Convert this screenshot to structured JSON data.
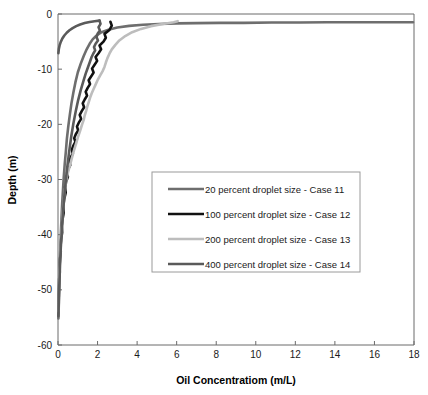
{
  "chart_data": {
    "type": "line",
    "title": "",
    "xlabel": "Oil Concentratiom (m/L)",
    "ylabel": "Depth (m)",
    "xlim": [
      0,
      18
    ],
    "ylim": [
      -60,
      0
    ],
    "grid": false,
    "legend_position": "center",
    "xticks": [
      "0",
      "2",
      "4",
      "6",
      "8",
      "10",
      "12",
      "14",
      "16",
      "18"
    ],
    "xtick_values": [
      0,
      2,
      4,
      6,
      8,
      10,
      12,
      14,
      16,
      18
    ],
    "yticks": [
      "0",
      "-10",
      "-20",
      "-30",
      "-40",
      "-50",
      "-60"
    ],
    "ytick_values": [
      0,
      -10,
      -20,
      -30,
      -40,
      -50,
      -60
    ],
    "series": [
      {
        "name": "20 percent droplet size - Case 11",
        "color": "#6e6e6e",
        "width": 2.6,
        "x": [
          17.95,
          16.4,
          15.0,
          13.6,
          12.2,
          10.8,
          9.4,
          8.2,
          7.0,
          6.0,
          5.1,
          4.3,
          3.6,
          3.0,
          2.55,
          2.2,
          1.95,
          1.75,
          1.6,
          1.45,
          1.3,
          1.15,
          1.0,
          0.88,
          0.78,
          0.68,
          0.6,
          0.52,
          0.45,
          0.4,
          0.34,
          0.29,
          0.25,
          0.21,
          0.18,
          0.15,
          0.13,
          0.1,
          0.08,
          0.06,
          0.05,
          0.04,
          0.03,
          0.02
        ],
        "y": [
          -1.5,
          -1.5,
          -1.5,
          -1.5,
          -1.55,
          -1.55,
          -1.6,
          -1.6,
          -1.65,
          -1.7,
          -1.8,
          -1.95,
          -2.15,
          -2.45,
          -2.85,
          -3.3,
          -3.9,
          -4.6,
          -5.4,
          -6.4,
          -7.6,
          -9.0,
          -10.6,
          -12.4,
          -14.2,
          -16.2,
          -18.2,
          -20.4,
          -22.6,
          -24.8,
          -27.2,
          -29.6,
          -32.0,
          -34.4,
          -36.8,
          -39.2,
          -41.6,
          -44.0,
          -46.4,
          -48.8,
          -51.0,
          -52.8,
          -54.2,
          -55.2
        ]
      },
      {
        "name": "100 percent droplet size - Case 12",
        "color": "#111111",
        "width": 2.6,
        "x": [
          2.65,
          2.72,
          2.6,
          2.35,
          2.42,
          2.3,
          2.1,
          2.18,
          2.05,
          1.9,
          1.98,
          1.85,
          1.72,
          1.8,
          1.68,
          1.55,
          1.62,
          1.5,
          1.4,
          1.47,
          1.35,
          1.25,
          1.32,
          1.2,
          1.1,
          1.17,
          1.05,
          0.96,
          1.02,
          0.9,
          0.82,
          0.88,
          0.77,
          0.7,
          0.75,
          0.64,
          0.58,
          0.62,
          0.52,
          0.46,
          0.5,
          0.41,
          0.36,
          0.39,
          0.31,
          0.27,
          0.29,
          0.23,
          0.19,
          0.21,
          0.16,
          0.13,
          0.14,
          0.1,
          0.08,
          0.09,
          0.06,
          0.05,
          0.04,
          0.03,
          0.02
        ],
        "y": [
          -1.4,
          -2.1,
          -2.9,
          -3.6,
          -4.3,
          -5.0,
          -5.7,
          -6.4,
          -7.1,
          -7.8,
          -8.5,
          -9.2,
          -9.9,
          -10.6,
          -11.3,
          -12.0,
          -12.7,
          -13.4,
          -14.1,
          -14.8,
          -15.5,
          -16.2,
          -16.9,
          -17.6,
          -18.3,
          -19.0,
          -19.7,
          -20.4,
          -21.1,
          -21.8,
          -22.5,
          -23.2,
          -23.9,
          -24.6,
          -25.3,
          -26.0,
          -26.7,
          -27.4,
          -28.1,
          -28.8,
          -29.5,
          -30.4,
          -31.4,
          -32.4,
          -33.6,
          -34.8,
          -36.0,
          -37.2,
          -38.4,
          -39.6,
          -40.8,
          -42.0,
          -43.2,
          -44.4,
          -45.6,
          -46.8,
          -48.0,
          -49.4,
          -50.8,
          -52.4,
          -54.0
        ]
      },
      {
        "name": "200 percent droplet size - Case 13",
        "color": "#bdbdbd",
        "width": 2.6,
        "x": [
          6.05,
          5.85,
          5.3,
          4.7,
          4.2,
          3.75,
          3.4,
          3.1,
          2.9,
          2.72,
          2.6,
          2.5,
          2.42,
          2.35,
          2.25,
          2.12,
          2.0,
          1.9,
          1.8,
          1.7,
          1.62,
          1.55,
          1.48,
          1.42,
          1.35,
          1.3,
          1.22,
          1.15,
          1.08,
          1.0,
          0.94,
          0.87,
          0.8,
          0.74,
          0.68,
          0.62,
          0.56,
          0.5,
          0.45,
          0.4,
          0.35,
          0.31,
          0.27,
          0.23,
          0.2,
          0.17,
          0.14,
          0.12,
          0.1,
          0.08,
          0.06,
          0.05,
          0.04,
          0.03,
          0.02
        ],
        "y": [
          -1.3,
          -1.5,
          -1.8,
          -2.2,
          -2.7,
          -3.3,
          -4.0,
          -4.8,
          -5.6,
          -6.4,
          -7.2,
          -8.0,
          -8.8,
          -9.6,
          -10.4,
          -11.2,
          -12.0,
          -12.8,
          -13.6,
          -14.4,
          -15.2,
          -16.0,
          -16.8,
          -17.6,
          -18.4,
          -19.2,
          -20.0,
          -20.8,
          -21.6,
          -22.4,
          -23.2,
          -24.0,
          -24.8,
          -25.6,
          -26.4,
          -27.2,
          -28.0,
          -28.8,
          -29.6,
          -30.6,
          -31.8,
          -33.2,
          -34.8,
          -36.4,
          -38.0,
          -39.6,
          -41.2,
          -42.8,
          -44.4,
          -46.0,
          -47.6,
          -49.2,
          -50.8,
          -52.4,
          -54.0
        ]
      },
      {
        "name": "400 percent droplet size - Case 14",
        "color": "#5a5a5a",
        "width": 2.6,
        "x": [
          2.1,
          2.15,
          2.05,
          2.12,
          2.0,
          1.95,
          2.02,
          1.9,
          1.82,
          1.88,
          1.78,
          1.7,
          1.62,
          1.52,
          1.4,
          1.28,
          1.15,
          1.02,
          0.9,
          0.78,
          0.67,
          0.57,
          0.48,
          0.4,
          0.33,
          0.27,
          0.22,
          0.18,
          0.14,
          0.11,
          0.09,
          0.07,
          0.05,
          0.04,
          0.03,
          0.02
        ],
        "y": [
          -1.2,
          -1.8,
          -2.4,
          -3.0,
          -3.6,
          -4.2,
          -4.8,
          -5.4,
          -6.0,
          -6.6,
          -7.2,
          -7.8,
          -8.6,
          -9.6,
          -10.8,
          -12.2,
          -13.8,
          -15.6,
          -17.6,
          -19.8,
          -22.2,
          -24.8,
          -27.4,
          -30.0,
          -32.6,
          -35.2,
          -37.6,
          -40.0,
          -42.4,
          -44.6,
          -46.8,
          -48.8,
          -50.6,
          -52.2,
          -53.6,
          -54.8
        ]
      },
      {
        "name": "400 percent droplet size - Case 14 shallow arc",
        "color": "#5a5a5a",
        "width": 2.6,
        "x": [
          2.1,
          1.85,
          1.6,
          1.35,
          1.12,
          0.92,
          0.74,
          0.58,
          0.44,
          0.32,
          0.22,
          0.14,
          0.08,
          0.04,
          0.02
        ],
        "y": [
          -1.2,
          -1.3,
          -1.45,
          -1.65,
          -1.9,
          -2.2,
          -2.55,
          -2.95,
          -3.4,
          -3.9,
          -4.45,
          -5.05,
          -5.7,
          -6.4,
          -7.1
        ]
      }
    ],
    "legend_entries": [
      {
        "label": "20 percent droplet size - Case 11",
        "color": "#6e6e6e"
      },
      {
        "label": "100 percent droplet size - Case 12",
        "color": "#111111"
      },
      {
        "label": "200 percent droplet size - Case 13",
        "color": "#bdbdbd"
      },
      {
        "label": "400 percent droplet size - Case 14",
        "color": "#5a5a5a"
      }
    ]
  }
}
